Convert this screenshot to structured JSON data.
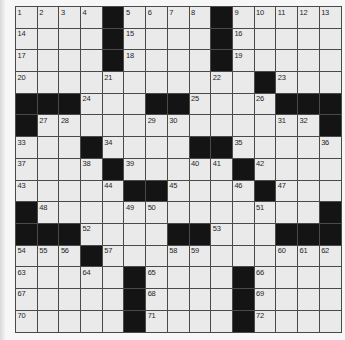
{
  "page": {
    "background": "#f7f7f7"
  },
  "grid": {
    "rows": 15,
    "cols": 15,
    "cell_size_px": 21.7,
    "colors": {
      "white_cell": "#eaeaea",
      "black_cell": "#141414",
      "line": "#4a4a4a",
      "number": "#1f1f1f"
    },
    "black_cells": [
      [
        1,
        5
      ],
      [
        1,
        10
      ],
      [
        2,
        5
      ],
      [
        2,
        10
      ],
      [
        3,
        5
      ],
      [
        3,
        10
      ],
      [
        4,
        12
      ],
      [
        5,
        1
      ],
      [
        5,
        2
      ],
      [
        5,
        3
      ],
      [
        5,
        7
      ],
      [
        5,
        8
      ],
      [
        5,
        13
      ],
      [
        5,
        14
      ],
      [
        5,
        15
      ],
      [
        6,
        1
      ],
      [
        6,
        15
      ],
      [
        7,
        4
      ],
      [
        7,
        9
      ],
      [
        7,
        10
      ],
      [
        8,
        5
      ],
      [
        8,
        11
      ],
      [
        9,
        6
      ],
      [
        9,
        7
      ],
      [
        9,
        12
      ],
      [
        10,
        1
      ],
      [
        10,
        15
      ],
      [
        11,
        1
      ],
      [
        11,
        2
      ],
      [
        11,
        3
      ],
      [
        11,
        8
      ],
      [
        11,
        9
      ],
      [
        11,
        13
      ],
      [
        11,
        14
      ],
      [
        11,
        15
      ],
      [
        12,
        4
      ],
      [
        13,
        6
      ],
      [
        13,
        11
      ],
      [
        14,
        6
      ],
      [
        14,
        11
      ],
      [
        15,
        6
      ],
      [
        15,
        11
      ]
    ],
    "numbers": [
      [
        1,
        1,
        1
      ],
      [
        1,
        2,
        2
      ],
      [
        1,
        3,
        3
      ],
      [
        1,
        4,
        4
      ],
      [
        1,
        6,
        5
      ],
      [
        1,
        7,
        6
      ],
      [
        1,
        8,
        7
      ],
      [
        1,
        9,
        8
      ],
      [
        1,
        11,
        9
      ],
      [
        1,
        12,
        10
      ],
      [
        1,
        13,
        11
      ],
      [
        1,
        14,
        12
      ],
      [
        1,
        15,
        13
      ],
      [
        2,
        1,
        14
      ],
      [
        2,
        6,
        15
      ],
      [
        2,
        11,
        16
      ],
      [
        3,
        1,
        17
      ],
      [
        3,
        6,
        18
      ],
      [
        3,
        11,
        19
      ],
      [
        4,
        1,
        20
      ],
      [
        4,
        5,
        21
      ],
      [
        4,
        10,
        22
      ],
      [
        4,
        13,
        23
      ],
      [
        5,
        4,
        24
      ],
      [
        5,
        9,
        25
      ],
      [
        5,
        12,
        26
      ],
      [
        6,
        2,
        27
      ],
      [
        6,
        3,
        28
      ],
      [
        6,
        7,
        29
      ],
      [
        6,
        8,
        30
      ],
      [
        6,
        13,
        31
      ],
      [
        6,
        14,
        32
      ],
      [
        7,
        1,
        33
      ],
      [
        7,
        5,
        34
      ],
      [
        7,
        11,
        35
      ],
      [
        7,
        15,
        36
      ],
      [
        8,
        1,
        37
      ],
      [
        8,
        4,
        38
      ],
      [
        8,
        6,
        39
      ],
      [
        8,
        9,
        40
      ],
      [
        8,
        10,
        41
      ],
      [
        8,
        12,
        42
      ],
      [
        9,
        1,
        43
      ],
      [
        9,
        5,
        44
      ],
      [
        9,
        8,
        45
      ],
      [
        9,
        11,
        46
      ],
      [
        9,
        13,
        47
      ],
      [
        10,
        2,
        48
      ],
      [
        10,
        6,
        49
      ],
      [
        10,
        7,
        50
      ],
      [
        10,
        12,
        51
      ],
      [
        11,
        4,
        52
      ],
      [
        11,
        10,
        53
      ],
      [
        12,
        1,
        54
      ],
      [
        12,
        2,
        55
      ],
      [
        12,
        3,
        56
      ],
      [
        12,
        5,
        57
      ],
      [
        12,
        8,
        58
      ],
      [
        12,
        9,
        59
      ],
      [
        12,
        13,
        60
      ],
      [
        12,
        14,
        61
      ],
      [
        12,
        15,
        62
      ],
      [
        13,
        1,
        63
      ],
      [
        13,
        4,
        64
      ],
      [
        13,
        7,
        65
      ],
      [
        13,
        12,
        66
      ],
      [
        14,
        1,
        67
      ],
      [
        14,
        7,
        68
      ],
      [
        14,
        12,
        69
      ],
      [
        15,
        1,
        70
      ],
      [
        15,
        7,
        71
      ],
      [
        15,
        12,
        72
      ]
    ]
  }
}
